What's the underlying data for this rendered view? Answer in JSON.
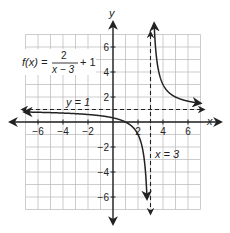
{
  "function_label": {
    "prefix": "f(x) =",
    "numerator": "2",
    "denominator": "x − 3",
    "suffix": "+ 1"
  },
  "axes": {
    "x_label": "x",
    "y_label": "y"
  },
  "asymptotes": {
    "horizontal_label": "y = 1",
    "vertical_label": "x = 3"
  },
  "x_ticks": [
    {
      "v": -6,
      "label": "−6"
    },
    {
      "v": -4,
      "label": "−4"
    },
    {
      "v": -2,
      "label": "−2"
    },
    {
      "v": 2,
      "label": "2"
    },
    {
      "v": 4,
      "label": "4"
    },
    {
      "v": 6,
      "label": "6"
    }
  ],
  "y_ticks": [
    {
      "v": 6,
      "label": "6"
    },
    {
      "v": 4,
      "label": "4"
    },
    {
      "v": 2,
      "label": "2"
    },
    {
      "v": -2,
      "label": "−2"
    },
    {
      "v": -4,
      "label": "−4"
    },
    {
      "v": -6,
      "label": "−6"
    }
  ],
  "grid": {
    "xmin": -7,
    "xmax": 7,
    "ymin": -7,
    "ymax": 7
  },
  "colors": {
    "grid": "#b8b8b8",
    "axis": "#222222",
    "curve": "#222222"
  }
}
